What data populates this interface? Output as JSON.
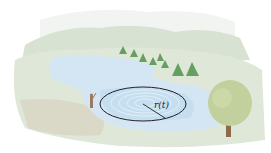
{
  "figure": {
    "radius_label": "r(t)",
    "colors": {
      "sky_haze": "#e6ebe6",
      "hills": "#d4dfcf",
      "land": "#dde6d6",
      "shore_sand": "#d9d2c0",
      "water": "#cfe3f1",
      "water_deep": "#b9d6ec",
      "ripple_outline": "#1e1e2a",
      "conifer": "#5f9a5a",
      "tree_canopy": "#bfcf98",
      "tree_trunk": "#8c6a4a",
      "person": "#9a7a60"
    }
  }
}
